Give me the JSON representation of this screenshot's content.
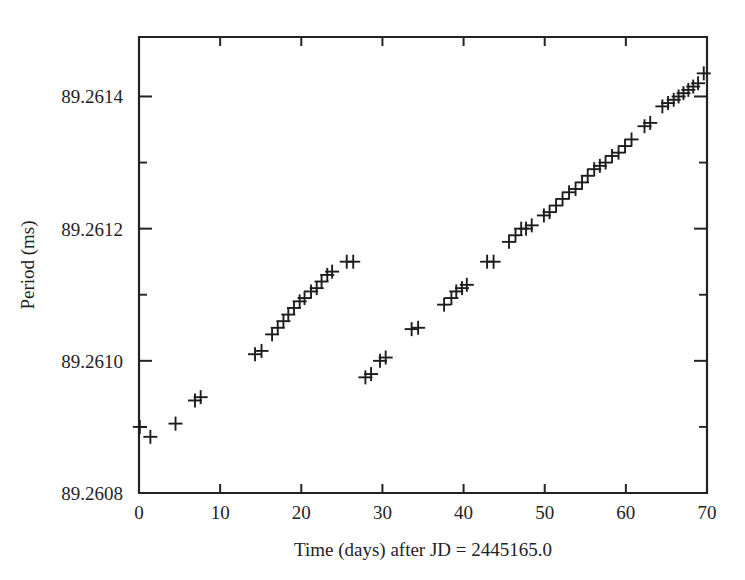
{
  "chart_data": {
    "type": "scatter",
    "title": "",
    "xlabel": "Time (days) after JD = 2445165.0",
    "ylabel": "Period (ms)",
    "xlim": [
      0,
      70
    ],
    "ylim": [
      89.2608,
      89.26149
    ],
    "xticks": [
      0,
      10,
      20,
      30,
      40,
      50,
      60,
      70
    ],
    "xticklabels": [
      "0",
      "10",
      "20",
      "30",
      "40",
      "50",
      "60",
      "70"
    ],
    "yticks": [
      89.2608,
      89.261,
      89.2612,
      89.2614
    ],
    "yticklabels": [
      "89.2608",
      "89.2610",
      "89.2612",
      "89.2614"
    ],
    "y_minor_ticks": [
      89.2609,
      89.2611,
      89.2613
    ],
    "grid": false,
    "legend": null,
    "marker": "plus",
    "marker_color": "#1d1d1d",
    "series": [
      {
        "name": "Period measurements",
        "x": [
          0.1,
          1.4,
          4.5,
          6.9,
          7.6,
          14.3,
          15.1,
          16.4,
          17.1,
          17.8,
          18.4,
          19.1,
          19.8,
          20.4,
          21.2,
          21.9,
          22.5,
          23.2,
          23.8,
          25.6,
          26.4,
          27.9,
          28.6,
          29.7,
          30.4,
          33.6,
          34.4,
          37.6,
          38.5,
          39.1,
          39.8,
          40.4,
          42.9,
          43.7,
          45.6,
          46.4,
          47.1,
          47.7,
          48.4,
          49.9,
          50.6,
          51.4,
          52.2,
          53.0,
          53.8,
          54.6,
          55.3,
          56.1,
          56.8,
          57.5,
          58.3,
          59.1,
          59.9,
          60.7,
          62.3,
          63.0,
          64.5,
          65.2,
          65.9,
          66.5,
          67.1,
          67.7,
          68.3,
          68.9,
          69.6
        ],
        "y": [
          89.2609,
          89.260885,
          89.260905,
          89.26094,
          89.260945,
          89.26101,
          89.261015,
          89.26104,
          89.26105,
          89.26106,
          89.26107,
          89.26108,
          89.26109,
          89.261095,
          89.261105,
          89.26111,
          89.26112,
          89.26113,
          89.261135,
          89.26115,
          89.26115,
          89.260975,
          89.26098,
          89.261,
          89.261005,
          89.261048,
          89.26105,
          89.261085,
          89.261095,
          89.261105,
          89.26111,
          89.261115,
          89.26115,
          89.26115,
          89.26118,
          89.26119,
          89.2612,
          89.2612,
          89.261205,
          89.26122,
          89.261225,
          89.261235,
          89.261245,
          89.261255,
          89.26126,
          89.26127,
          89.26128,
          89.26129,
          89.261295,
          89.2613,
          89.26131,
          89.261315,
          89.261325,
          89.261335,
          89.261355,
          89.26136,
          89.261385,
          89.26139,
          89.261395,
          89.2614,
          89.261405,
          89.26141,
          89.261415,
          89.26142,
          89.261435
        ]
      }
    ]
  },
  "axes": {
    "x_title": "Time (days) after JD = 2445165.0",
    "y_title": "Period (ms)"
  }
}
